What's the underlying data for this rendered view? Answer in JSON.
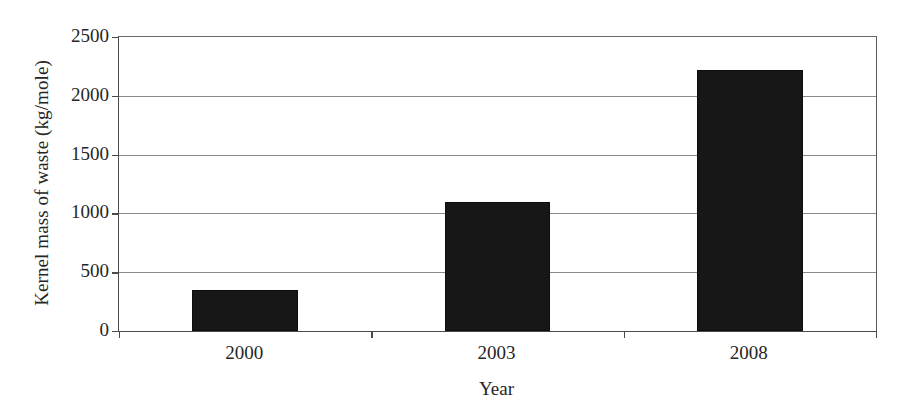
{
  "chart_data": {
    "type": "bar",
    "title": "",
    "xlabel": "Year",
    "ylabel": "Kernel mass of waste (kg/mole)",
    "categories": [
      "2000",
      "2003",
      "2008"
    ],
    "values": [
      350,
      1100,
      2220
    ],
    "series": [
      {
        "name": "Kernel mass of waste",
        "values": [
          350,
          1100,
          2220
        ]
      }
    ],
    "ylim": [
      0,
      2500
    ],
    "ytick_labels": [
      "0",
      "500",
      "1000",
      "1500",
      "2000",
      "2500"
    ],
    "ytick_values": [
      0,
      500,
      1000,
      1500,
      2000,
      2500
    ],
    "grid": true,
    "grid_axis": "y",
    "legend": false,
    "legend_position": "none",
    "bar_color": "#171717",
    "axis_color": "#4a4a4a",
    "gridline_color": "#8a8a8a",
    "background_color": "#ffffff",
    "bar_width_fraction": 0.42
  }
}
